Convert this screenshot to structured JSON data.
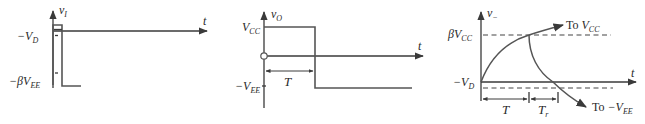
{
  "figure": {
    "panels": [
      {
        "id": "a",
        "y_axis_label": "v",
        "y_axis_sub": "I",
        "x_axis_label": "t",
        "levels": [
          {
            "label": "−V",
            "sub": "D"
          },
          {
            "label": "−βV",
            "sub": "EE"
          }
        ]
      },
      {
        "id": "b",
        "y_axis_label": "v",
        "y_axis_sub": "O",
        "x_axis_label": "t",
        "levels": [
          {
            "label": "V",
            "sub": "CC"
          },
          {
            "label": "−V",
            "sub": "EE"
          }
        ],
        "interval_label": "T"
      },
      {
        "id": "c",
        "y_axis_label": "v",
        "y_axis_sub": "−",
        "x_axis_label": "t",
        "levels": [
          {
            "label": "βV",
            "sub": "CC"
          },
          {
            "label": "−V",
            "sub": "D"
          }
        ],
        "curve_labels": [
          {
            "prefix": "To ",
            "label": "V",
            "sub": "CC"
          },
          {
            "prefix": "To ",
            "label": "−V",
            "sub": "EE"
          }
        ],
        "interval_labels": [
          {
            "label": "T",
            "sub": ""
          },
          {
            "label": "T",
            "sub": "r"
          }
        ]
      }
    ],
    "colors": {
      "line": "#3a3a3a",
      "waveform": "#555555",
      "text": "#2a2a2a",
      "background": "#ffffff"
    }
  }
}
